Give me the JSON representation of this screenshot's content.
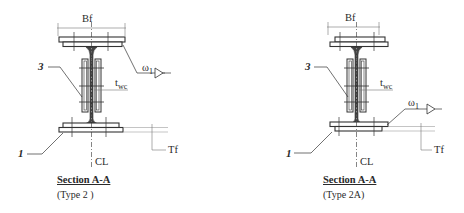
{
  "figure": {
    "drawings": [
      {
        "id": "type-2",
        "labels": {
          "flange_width": "Bf",
          "weld_symbol": "ω",
          "weld_subscript": "1",
          "web_thickness": "t",
          "web_thickness_subscript": "wc",
          "flange_thickness": "Tf",
          "centerline": "CL",
          "callout_stiffener": "3",
          "callout_flange_plate": "1"
        },
        "title": "Section  A-A",
        "type_label": "(Type 2 )",
        "weld_location": "top-flange"
      },
      {
        "id": "type-2a",
        "labels": {
          "flange_width": "Bf",
          "weld_symbol": "ω",
          "weld_subscript": "1",
          "web_thickness": "t",
          "web_thickness_subscript": "wc",
          "flange_thickness": "Tf",
          "centerline": "CL",
          "callout_stiffener": "3",
          "callout_flange_plate": "1"
        },
        "title": "Section  A-A",
        "type_label": "(Type 2A)",
        "weld_location": "bottom-flange"
      }
    ],
    "colors": {
      "line": "#333333",
      "background": "#ffffff"
    }
  }
}
